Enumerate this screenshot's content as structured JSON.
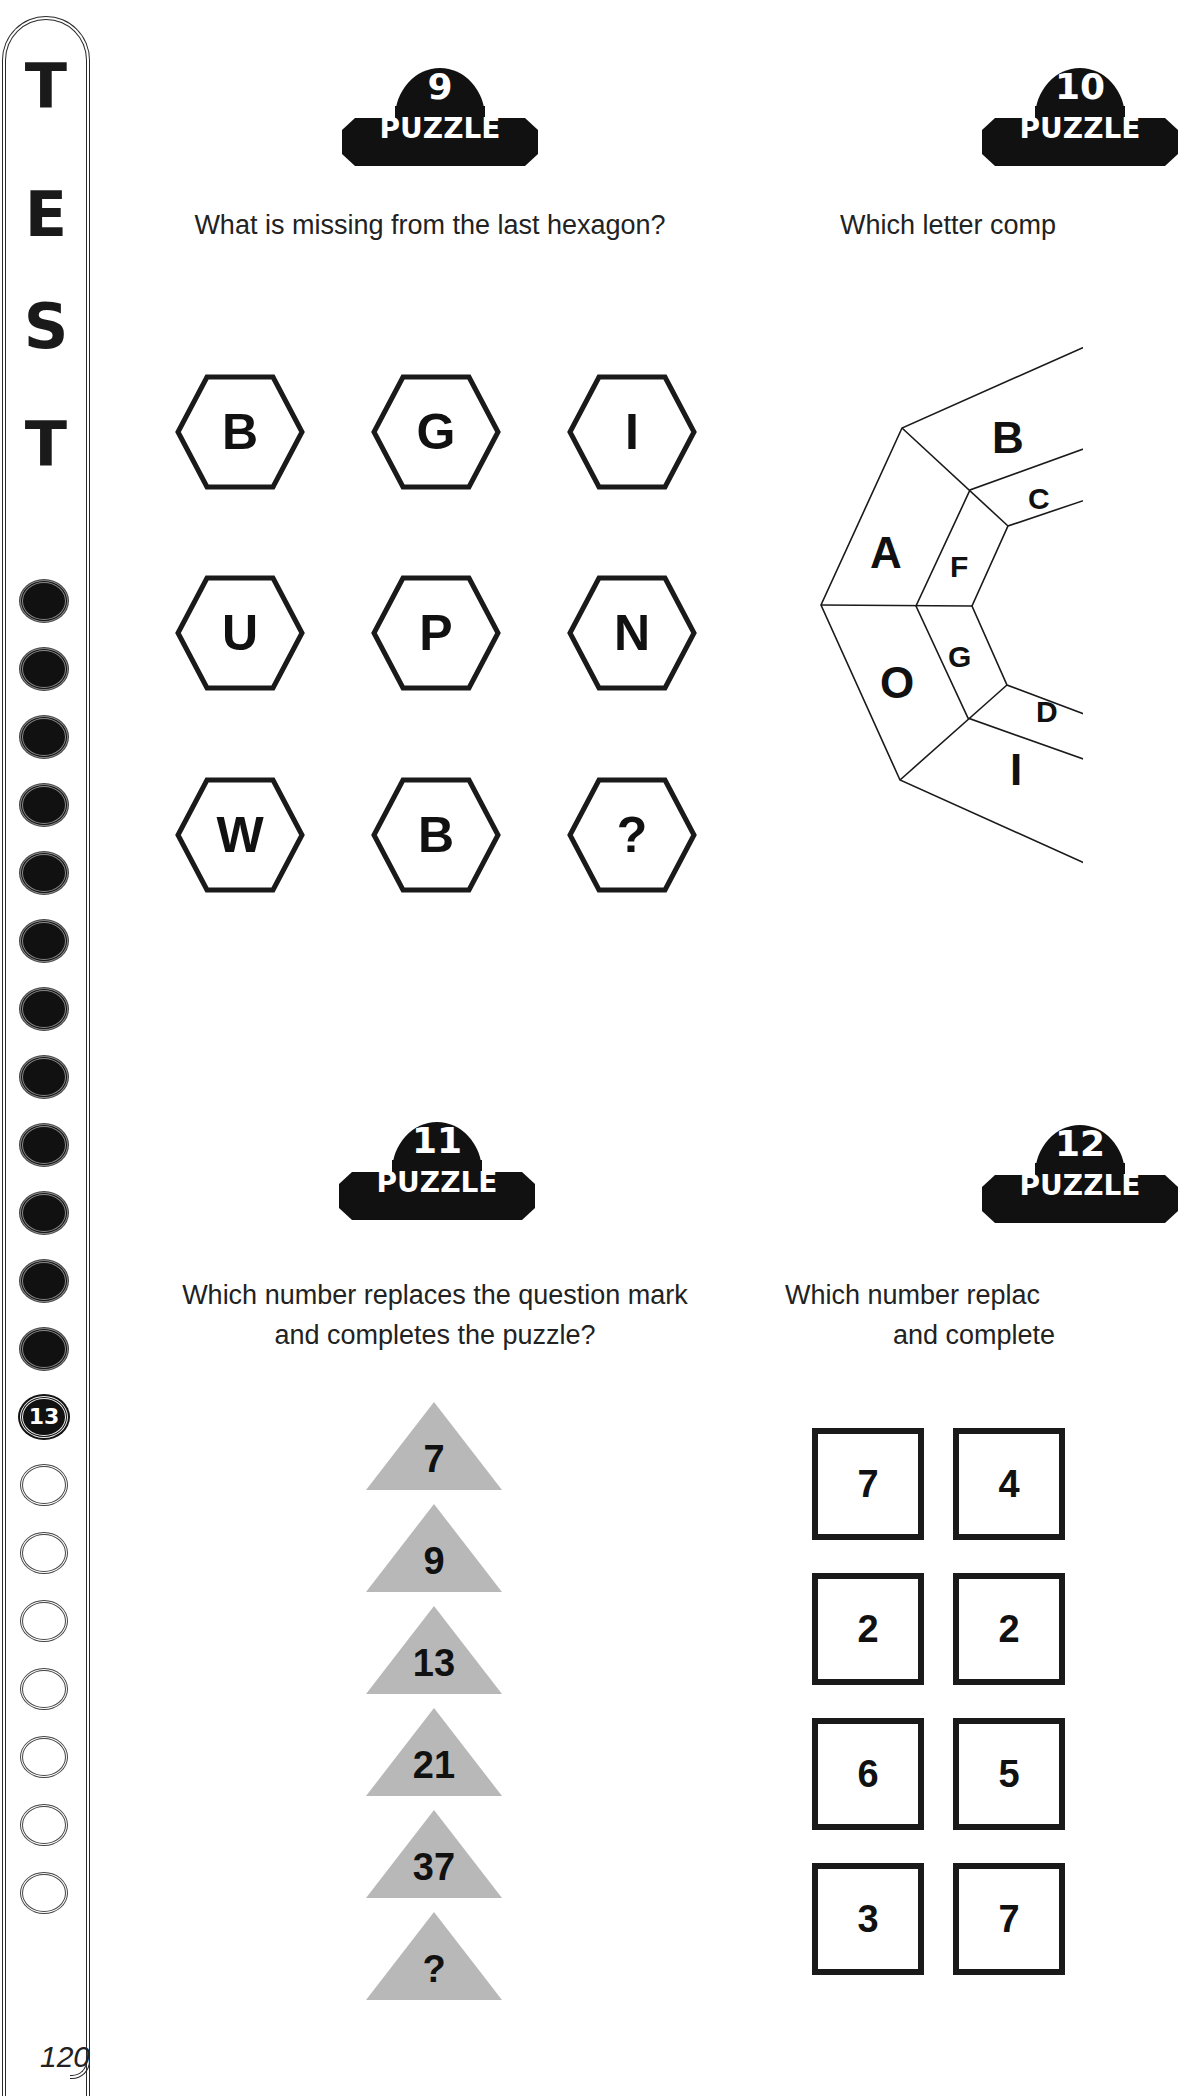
{
  "sidebar": {
    "title_letters": [
      "T",
      "E",
      "S",
      "T"
    ],
    "progress": {
      "completed_count": 12,
      "current": "13",
      "remaining_count": 7
    },
    "page_number": "120"
  },
  "puzzles": [
    {
      "badge_number": "9",
      "badge_label": "PUZZLE",
      "question": "What is missing from the last hexagon?",
      "hexagons": [
        [
          "B",
          "G",
          "I"
        ],
        [
          "U",
          "P",
          "N"
        ],
        [
          "W",
          "B",
          "?"
        ]
      ]
    },
    {
      "badge_number": "10",
      "badge_label": "PUZZLE",
      "question": "Which letter comp",
      "octagon_outer_visible": [
        "B",
        "A",
        "O",
        "I"
      ],
      "octagon_inner_visible": [
        "C",
        "F",
        "G",
        "D"
      ]
    },
    {
      "badge_number": "11",
      "badge_label": "PUZZLE",
      "question_line1": "Which number replaces the question mark",
      "question_line2": "and completes the puzzle?",
      "triangles": [
        "7",
        "9",
        "13",
        "21",
        "37",
        "?"
      ],
      "triangle_color": "#b8b8b8"
    },
    {
      "badge_number": "12",
      "badge_label": "PUZZLE",
      "question_line1": "Which number replac",
      "question_line2": "and complete",
      "squares": [
        [
          "7",
          "4"
        ],
        [
          "2",
          "2"
        ],
        [
          "6",
          "5"
        ],
        [
          "3",
          "7"
        ]
      ]
    }
  ]
}
